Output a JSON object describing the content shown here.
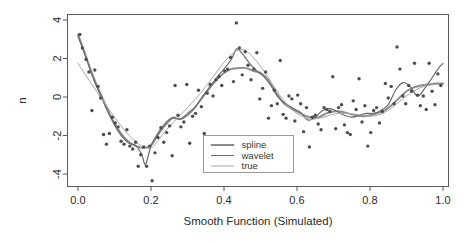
{
  "chart_data": {
    "type": "scatter",
    "title": "",
    "subtitle": "",
    "xlabel": "Smooth Function (Simulated)",
    "ylabel": "n",
    "xlim": [
      -0.03,
      1.03
    ],
    "ylim": [
      -4.7,
      4.3
    ],
    "grid": false,
    "legend_position": "bottom-center-inside",
    "xticks": [
      0.0,
      0.2,
      0.4,
      0.6,
      0.8,
      1.0
    ],
    "xtick_labels": [
      "0.0",
      "0.2",
      "0.4",
      "0.6",
      "0.8",
      "1.0"
    ],
    "yticks": [
      4,
      2,
      0,
      -2,
      -4
    ],
    "ytick_labels": [
      "4",
      "2",
      "0",
      "-2",
      "-4"
    ],
    "legend": [
      {
        "name": "spline",
        "color": "#8c8c8c",
        "width": 1.9
      },
      {
        "name": "wavelet",
        "color": "#6b6b6b",
        "width": 1.2
      },
      {
        "name": "true",
        "color": "#a8a8a8",
        "width": 1.0
      }
    ],
    "point_color": "#4d4d4d",
    "point_radius": 1.7,
    "points": [
      [
        0.005,
        3.25
      ],
      [
        0.012,
        2.55
      ],
      [
        0.022,
        1.95
      ],
      [
        0.03,
        1.3
      ],
      [
        0.038,
        -0.7
      ],
      [
        0.046,
        1.4
      ],
      [
        0.055,
        0.55
      ],
      [
        0.062,
        -0.05
      ],
      [
        0.07,
        -1.95
      ],
      [
        0.078,
        -2.45
      ],
      [
        0.086,
        -1.9
      ],
      [
        0.094,
        -1.05
      ],
      [
        0.102,
        -1.35
      ],
      [
        0.11,
        -1.55
      ],
      [
        0.118,
        -2.3
      ],
      [
        0.126,
        -2.45
      ],
      [
        0.134,
        -1.7
      ],
      [
        0.142,
        -2.55
      ],
      [
        0.15,
        -2.7
      ],
      [
        0.158,
        -2.35
      ],
      [
        0.165,
        -3.6
      ],
      [
        0.172,
        -3.0
      ],
      [
        0.18,
        -2.6
      ],
      [
        0.188,
        -3.6
      ],
      [
        0.196,
        -2.55
      ],
      [
        0.203,
        -4.35
      ],
      [
        0.211,
        -2.9
      ],
      [
        0.219,
        -2.1
      ],
      [
        0.227,
        -1.6
      ],
      [
        0.235,
        -2.35
      ],
      [
        0.243,
        -1.85
      ],
      [
        0.251,
        -1.5
      ],
      [
        0.258,
        -3.05
      ],
      [
        0.266,
        0.6
      ],
      [
        0.274,
        -0.95
      ],
      [
        0.282,
        -1.55
      ],
      [
        0.29,
        -1.3
      ],
      [
        0.298,
        0.65
      ],
      [
        0.306,
        -2.4
      ],
      [
        0.314,
        -1.0
      ],
      [
        0.322,
        -0.85
      ],
      [
        0.33,
        0.35
      ],
      [
        0.338,
        -0.5
      ],
      [
        0.346,
        -1.9
      ],
      [
        0.354,
        0.2
      ],
      [
        0.362,
        0.65
      ],
      [
        0.37,
        0.05
      ],
      [
        0.378,
        0.9
      ],
      [
        0.386,
        1.05
      ],
      [
        0.394,
        0.6
      ],
      [
        0.402,
        1.35
      ],
      [
        0.41,
        1.45
      ],
      [
        0.418,
        2.05
      ],
      [
        0.426,
        0.8
      ],
      [
        0.434,
        3.85
      ],
      [
        0.442,
        2.55
      ],
      [
        0.45,
        1.15
      ],
      [
        0.458,
        2.35
      ],
      [
        0.466,
        1.65
      ],
      [
        0.474,
        0.9
      ],
      [
        0.482,
        1.45
      ],
      [
        0.49,
        2.3
      ],
      [
        0.498,
        -0.1
      ],
      [
        0.506,
        0.45
      ],
      [
        0.514,
        1.3
      ],
      [
        0.522,
        -1.1
      ],
      [
        0.53,
        -0.45
      ],
      [
        0.538,
        0.35
      ],
      [
        0.546,
        -0.35
      ],
      [
        0.554,
        1.9
      ],
      [
        0.562,
        -0.9
      ],
      [
        0.57,
        -1.1
      ],
      [
        0.578,
        0.05
      ],
      [
        0.586,
        -0.1
      ],
      [
        0.594,
        -1.25
      ],
      [
        0.602,
        0.1
      ],
      [
        0.61,
        -0.35
      ],
      [
        0.618,
        -1.8
      ],
      [
        0.626,
        -0.55
      ],
      [
        0.634,
        -2.6
      ],
      [
        0.642,
        -1.05
      ],
      [
        0.65,
        -0.95
      ],
      [
        0.658,
        -1.4
      ],
      [
        0.666,
        -1.7
      ],
      [
        0.674,
        -0.55
      ],
      [
        0.682,
        -0.65
      ],
      [
        0.69,
        -0.75
      ],
      [
        0.698,
        1.05
      ],
      [
        0.706,
        -1.65
      ],
      [
        0.714,
        -0.55
      ],
      [
        0.722,
        -0.4
      ],
      [
        0.73,
        -1.45
      ],
      [
        0.738,
        -1.85
      ],
      [
        0.746,
        -1.95
      ],
      [
        0.754,
        -0.2
      ],
      [
        0.762,
        -0.65
      ],
      [
        0.77,
        0.95
      ],
      [
        0.778,
        -1.3
      ],
      [
        0.786,
        -0.45
      ],
      [
        0.794,
        -2.55
      ],
      [
        0.802,
        -1.85
      ],
      [
        0.81,
        -0.7
      ],
      [
        0.818,
        -0.55
      ],
      [
        0.826,
        -1.35
      ],
      [
        0.834,
        -0.75
      ],
      [
        0.842,
        0.7
      ],
      [
        0.85,
        -0.05
      ],
      [
        0.858,
        0.55
      ],
      [
        0.866,
        -0.35
      ],
      [
        0.874,
        2.6
      ],
      [
        0.882,
        1.45
      ],
      [
        0.89,
        0.05
      ],
      [
        0.898,
        -0.35
      ],
      [
        0.906,
        0.6
      ],
      [
        0.914,
        0.3
      ],
      [
        0.922,
        1.75
      ],
      [
        0.93,
        0.1
      ],
      [
        0.938,
        -0.45
      ],
      [
        0.946,
        0.05
      ],
      [
        0.954,
        -0.65
      ],
      [
        0.962,
        1.75
      ],
      [
        0.97,
        0.3
      ],
      [
        0.978,
        -0.4
      ],
      [
        0.986,
        1.2
      ],
      [
        0.994,
        0.6
      ]
    ],
    "series": [
      {
        "name": "spline",
        "color": "#8c8c8c",
        "width": 1.9,
        "x": [
          0.0,
          0.02,
          0.04,
          0.06,
          0.08,
          0.1,
          0.12,
          0.14,
          0.16,
          0.18,
          0.2,
          0.22,
          0.24,
          0.26,
          0.28,
          0.3,
          0.32,
          0.34,
          0.36,
          0.38,
          0.4,
          0.42,
          0.44,
          0.46,
          0.48,
          0.5,
          0.52,
          0.54,
          0.56,
          0.58,
          0.6,
          0.62,
          0.64,
          0.66,
          0.68,
          0.7,
          0.72,
          0.74,
          0.76,
          0.78,
          0.8,
          0.82,
          0.84,
          0.86,
          0.88,
          0.9,
          0.92,
          0.94,
          0.96,
          0.98,
          1.0
        ],
        "y": [
          3.25,
          2.2,
          1.15,
          0.25,
          -0.6,
          -1.35,
          -1.95,
          -2.35,
          -2.55,
          -2.65,
          -2.5,
          -1.95,
          -1.45,
          -1.1,
          -1.15,
          -0.95,
          -0.55,
          -0.05,
          0.45,
          0.9,
          1.25,
          1.45,
          1.5,
          1.5,
          1.35,
          1.25,
          0.9,
          0.3,
          -0.25,
          -0.55,
          -0.75,
          -0.95,
          -1.05,
          -1.05,
          -0.85,
          -0.75,
          -0.75,
          -0.85,
          -0.95,
          -1.0,
          -0.95,
          -0.85,
          -0.7,
          -0.4,
          -0.05,
          0.3,
          0.5,
          0.6,
          0.65,
          0.7,
          0.7
        ]
      },
      {
        "name": "wavelet",
        "color": "#6b6b6b",
        "width": 1.2,
        "x": [
          0.0,
          0.02,
          0.04,
          0.06,
          0.08,
          0.1,
          0.12,
          0.14,
          0.16,
          0.175,
          0.185,
          0.2,
          0.22,
          0.24,
          0.26,
          0.28,
          0.3,
          0.32,
          0.34,
          0.36,
          0.38,
          0.4,
          0.42,
          0.435,
          0.45,
          0.47,
          0.49,
          0.51,
          0.53,
          0.55,
          0.57,
          0.59,
          0.61,
          0.63,
          0.65,
          0.67,
          0.69,
          0.71,
          0.73,
          0.75,
          0.77,
          0.79,
          0.81,
          0.83,
          0.85,
          0.87,
          0.89,
          0.91,
          0.93,
          0.95,
          0.97,
          0.99,
          1.0
        ],
        "y": [
          3.15,
          2.15,
          1.05,
          0.15,
          -0.7,
          -1.45,
          -2.05,
          -2.4,
          -2.55,
          -3.0,
          -3.5,
          -2.55,
          -1.85,
          -1.35,
          -1.05,
          -1.15,
          -0.85,
          -0.55,
          0.0,
          0.5,
          1.0,
          1.45,
          1.95,
          2.5,
          2.25,
          1.75,
          1.35,
          1.05,
          0.55,
          -0.05,
          -0.35,
          -0.6,
          -0.8,
          -1.2,
          -1.05,
          -0.7,
          -0.6,
          -0.75,
          -0.95,
          -1.05,
          -0.95,
          -0.85,
          -0.85,
          -0.7,
          -0.4,
          0.35,
          0.75,
          0.55,
          0.05,
          0.45,
          1.0,
          1.55,
          1.75
        ]
      },
      {
        "name": "true",
        "color": "#a8a8a8",
        "width": 1.0,
        "x": [
          0.0,
          0.02,
          0.04,
          0.06,
          0.08,
          0.1,
          0.12,
          0.14,
          0.16,
          0.18,
          0.2,
          0.22,
          0.24,
          0.26,
          0.28,
          0.3,
          0.32,
          0.34,
          0.36,
          0.38,
          0.4,
          0.42,
          0.44,
          0.46,
          0.48,
          0.5,
          0.52,
          0.54,
          0.56,
          0.58,
          0.6,
          0.62,
          0.64,
          0.66,
          0.68,
          0.7,
          0.72,
          0.74,
          0.76,
          0.78,
          0.8,
          0.82,
          0.84,
          0.86,
          0.88,
          0.9,
          0.92,
          0.94,
          0.96,
          0.98,
          1.0
        ],
        "y": [
          1.75,
          1.15,
          0.6,
          0.05,
          -0.5,
          -1.05,
          -1.55,
          -2.0,
          -2.35,
          -2.6,
          -2.65,
          -2.25,
          -1.75,
          -1.35,
          -0.95,
          -0.55,
          -0.15,
          0.3,
          0.8,
          1.3,
          1.8,
          2.2,
          2.45,
          2.4,
          2.05,
          1.6,
          1.05,
          0.45,
          -0.1,
          -0.55,
          -0.85,
          -1.05,
          -1.15,
          -1.1,
          -1.0,
          -0.9,
          -0.85,
          -0.85,
          -0.9,
          -0.95,
          -1.0,
          -0.95,
          -0.8,
          -0.55,
          -0.25,
          0.05,
          0.3,
          0.5,
          0.6,
          0.65,
          0.65
        ]
      }
    ]
  },
  "legend_panel": {
    "items": [
      "spline",
      "wavelet",
      "true"
    ]
  },
  "axes": {
    "x_title": "Smooth Function (Simulated)",
    "y_title": "n"
  }
}
